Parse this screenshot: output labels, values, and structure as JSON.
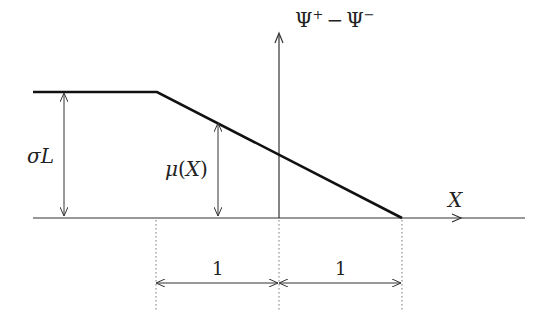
{
  "diagram": {
    "vertical_axis_label": {
      "main": "Ψ",
      "sup1": "+",
      "minus": "−",
      "main2": "Ψ",
      "sup2": "−"
    },
    "horizontal_axis_label": "X",
    "sigma_label": {
      "sym": "σ",
      "var": "L"
    },
    "mu_label": {
      "sym": "μ",
      "open": "(",
      "var": "X",
      "close": ")"
    },
    "interval_labels": [
      "1",
      "1"
    ],
    "colors": {
      "line": "#111111",
      "thin": "#333333",
      "dotted": "#777777"
    }
  }
}
